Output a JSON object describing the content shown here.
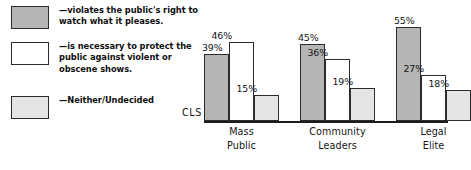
{
  "chart_data": {
    "type": "bar",
    "title": "",
    "subtitle": "",
    "xlabel": "",
    "ylabel": "CLS",
    "ylim": [
      0,
      60
    ],
    "grid": false,
    "legend_position": "left",
    "value_suffix": "%",
    "categories": [
      "Mass\nPublic",
      "Community\nLeaders",
      "Legal\nElite"
    ],
    "series": [
      {
        "name": "—violates the public's right to watch what it pleases.",
        "swatch_color": "#b5b5b5",
        "values": [
          39,
          46,
          55
        ],
        "labels": [
          "39%",
          "45%",
          "55%"
        ]
      },
      {
        "name": "—is necessary to protect the\npublic against violent or\nobscene shows.",
        "swatch_color": "#ffffff",
        "values": [
          46,
          36,
          27
        ],
        "labels": [
          "46%",
          "36%",
          "27%"
        ]
      },
      {
        "name": "—Neither/Undecided",
        "swatch_color": "#e5e5e5",
        "values": [
          15,
          19,
          18
        ],
        "labels": [
          "15%",
          "19%",
          "18%"
        ]
      }
    ],
    "groups": [
      {
        "category": "Mass\nPublic",
        "bars": [
          {
            "label": "39%",
            "value": 39,
            "color": "#b5b5b5"
          },
          {
            "label": "46%",
            "value": 46,
            "color": "#ffffff"
          },
          {
            "label": "15%",
            "value": 15,
            "color": "#e5e5e5"
          }
        ]
      },
      {
        "category": "Community\nLeaders",
        "bars": [
          {
            "label": "45%",
            "value": 45,
            "color": "#b5b5b5"
          },
          {
            "label": "36%",
            "value": 36,
            "color": "#ffffff"
          },
          {
            "label": "19%",
            "value": 19,
            "color": "#e5e5e5"
          }
        ]
      },
      {
        "category": "Legal\nElite",
        "bars": [
          {
            "label": "55%",
            "value": 55,
            "color": "#b5b5b5"
          },
          {
            "label": "27%",
            "value": 27,
            "color": "#ffffff"
          },
          {
            "label": "18%",
            "value": 18,
            "color": "#e5e5e5"
          }
        ]
      }
    ]
  },
  "legend": {
    "items": [
      {
        "label": "—violates the public's right to watch what it pleases.",
        "color": "#b5b5b5"
      },
      {
        "label": "—is necessary to protect the\npublic against violent or\nobscene shows.",
        "color": "#ffffff"
      },
      {
        "label": "—Neither/Undecided",
        "color": "#e5e5e5"
      }
    ]
  },
  "axis": {
    "y_label": "CLS"
  },
  "colors": {
    "bar_dark": "#b5b5b5",
    "bar_white": "#ffffff",
    "bar_light": "#e5e5e5",
    "outline": "#2b2b2b",
    "text": "#141414",
    "background": "#ffffff"
  }
}
